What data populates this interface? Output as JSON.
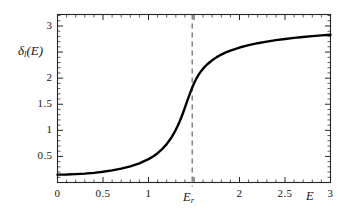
{
  "chart_data": {
    "type": "line",
    "title": "",
    "subtitle": "",
    "xlabel": "E",
    "ylabel_parts": {
      "symbol": "δ",
      "subscript": "l",
      "argument": "(E)"
    },
    "ylabel": "δ_l(E)",
    "xlim": [
      0,
      3
    ],
    "ylim": [
      0,
      3.22
    ],
    "grid": false,
    "legend": null,
    "frame": true,
    "x_ticks": [
      0,
      0.5,
      1,
      1.5,
      2,
      2.5,
      3
    ],
    "x_tick_labels": [
      "0",
      "0.5",
      "1",
      "",
      "2",
      "2.5",
      "3"
    ],
    "y_ticks": [
      0.5,
      1,
      1.5,
      2,
      2.5,
      3
    ],
    "y_tick_labels": [
      "0.5",
      "1",
      "1.5",
      "2",
      "",
      "3"
    ],
    "x_minor_tick_step": 0.1,
    "y_minor_tick_step": 0.1,
    "series": [
      {
        "name": "phase shift",
        "color": "#000000",
        "linewidth": 2.4,
        "style": "solid",
        "x": [
          0.0,
          0.1,
          0.2,
          0.3,
          0.4,
          0.5,
          0.6,
          0.7,
          0.8,
          0.9,
          1.0,
          1.05,
          1.1,
          1.15,
          1.2,
          1.25,
          1.3,
          1.32,
          1.34,
          1.36,
          1.38,
          1.4,
          1.42,
          1.44,
          1.45,
          1.46,
          1.47,
          1.48,
          1.49,
          1.5,
          1.51,
          1.52,
          1.53,
          1.54,
          1.56,
          1.58,
          1.6,
          1.62,
          1.65,
          1.7,
          1.75,
          1.8,
          1.85,
          1.9,
          2.0,
          2.1,
          2.2,
          2.3,
          2.4,
          2.5,
          2.6,
          2.7,
          2.8,
          2.9,
          3.0
        ],
        "y": [
          0.15,
          0.153,
          0.16,
          0.17,
          0.185,
          0.205,
          0.232,
          0.266,
          0.31,
          0.368,
          0.448,
          0.5,
          0.562,
          0.64,
          0.736,
          0.857,
          1.01,
          1.082,
          1.16,
          1.245,
          1.337,
          1.434,
          1.534,
          1.633,
          1.681,
          1.728,
          1.774,
          1.817,
          1.859,
          1.898,
          1.935,
          1.97,
          2.003,
          2.034,
          2.09,
          2.139,
          2.182,
          2.221,
          2.272,
          2.344,
          2.403,
          2.452,
          2.493,
          2.529,
          2.587,
          2.633,
          2.67,
          2.701,
          2.728,
          2.751,
          2.771,
          2.789,
          2.805,
          2.819,
          2.832
        ]
      }
    ],
    "annotations": [
      {
        "name": "resonance-line",
        "type": "vline",
        "x": 1.48,
        "style": "dashed",
        "color": "#555555",
        "label_text": "E",
        "label_subscript": "r",
        "label_position": "below-axis"
      }
    ]
  },
  "axis": {
    "x_label": "E",
    "y_label_symbol": "δ",
    "y_label_subscript": "l",
    "y_label_argument": "(E)"
  },
  "ticks": {
    "x": [
      {
        "value": 0,
        "label": "0"
      },
      {
        "value": 0.5,
        "label": "0.5"
      },
      {
        "value": 1,
        "label": "1"
      },
      {
        "value": 2,
        "label": "2"
      },
      {
        "value": 2.5,
        "label": "2.5"
      },
      {
        "value": 3,
        "label": "3"
      }
    ],
    "y": [
      {
        "value": 0.5,
        "label": "0.5"
      },
      {
        "value": 1,
        "label": "1"
      },
      {
        "value": 1.5,
        "label": "1.5"
      },
      {
        "value": 2,
        "label": "2"
      },
      {
        "value": 3,
        "label": "3"
      }
    ]
  },
  "annotation": {
    "resonance_symbol": "E",
    "resonance_subscript": "r"
  },
  "colors": {
    "curve": "#000000",
    "frame": "#262626",
    "dashed_line": "#555555",
    "background": "#ffffff",
    "text": "#141414"
  }
}
